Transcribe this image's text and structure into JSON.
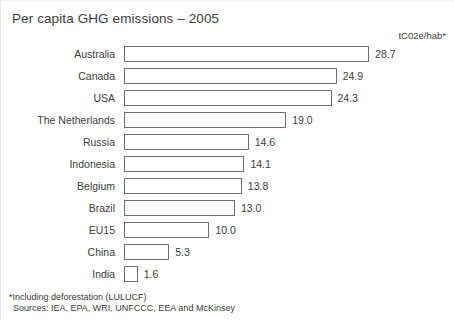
{
  "chart_data": {
    "type": "bar",
    "orientation": "horizontal",
    "title": "Per capita GHG emissions – 2005",
    "xlabel": "",
    "ylabel": "",
    "units_label": "tC02e/hab*",
    "grid": false,
    "legend": false,
    "xlim": [
      0,
      28.7
    ],
    "categories": [
      "Australia",
      "Canada",
      "USA",
      "The Netherlands",
      "Russia",
      "Indonesia",
      "Belgium",
      "Brazil",
      "EU15",
      "China",
      "India"
    ],
    "values": [
      28.7,
      24.9,
      24.3,
      19.0,
      14.6,
      14.1,
      13.8,
      13.0,
      10.0,
      5.3,
      1.6
    ],
    "value_labels": [
      "28.7",
      "24.9",
      "24.3",
      "19.0",
      "14.6",
      "14.1",
      "13.8",
      "13.0",
      "10.0",
      "5.3",
      "1.6"
    ]
  },
  "footnotes": {
    "deforestation": "*Including deforestation (LULUCF)",
    "sources": "Sources: IEA, EPA, WRI, UNFCCC, EEA and McKinsey"
  },
  "style": {
    "bar_fill": "#ffffff",
    "bar_border": "#6e6e73",
    "text_color": "#3c3c3c",
    "background": "#ffffff",
    "px_per_unit": 8.54
  }
}
